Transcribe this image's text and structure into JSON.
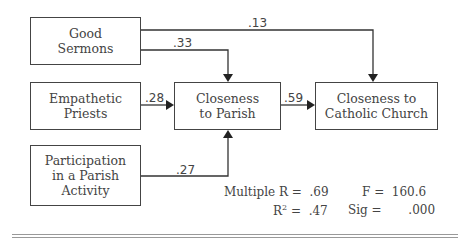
{
  "diagram": {
    "nodes": {
      "good_sermons": {
        "line1": "Good",
        "line2": "Sermons"
      },
      "empathetic_priests": {
        "line1": "Empathetic",
        "line2": "Priests"
      },
      "participation": {
        "line1": "Participation",
        "line2": "in a Parish",
        "line3": "Activity"
      },
      "closeness_parish": {
        "line1": "Closeness",
        "line2": "to Parish"
      },
      "closeness_church": {
        "line1": "Closeness to",
        "line2": "Catholic Church"
      }
    },
    "edges": {
      "sermons_to_church": ".13",
      "sermons_to_parish": ".33",
      "priests_to_parish": ".28",
      "participation_to_parish": ".27",
      "parish_to_church": ".59"
    },
    "stats": {
      "multiple_r_label": "Multiple R",
      "multiple_r_value": "=  .69",
      "r2_label": "R",
      "r2_sup": "2",
      "r2_value": "=  .47",
      "f_label": "F",
      "f_value": "=  160.6",
      "sig_label": "Sig",
      "sig_value": "=       .000"
    }
  }
}
